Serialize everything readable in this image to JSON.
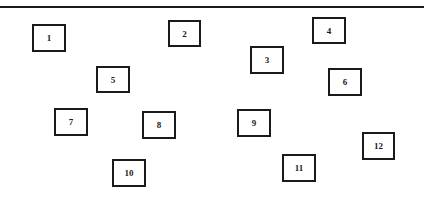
{
  "diagram": {
    "boxes": [
      {
        "label": "1",
        "x": 32,
        "y": 24,
        "w": 34,
        "h": 28
      },
      {
        "label": "2",
        "x": 168,
        "y": 20,
        "w": 33,
        "h": 27
      },
      {
        "label": "3",
        "x": 250,
        "y": 46,
        "w": 34,
        "h": 28
      },
      {
        "label": "4",
        "x": 312,
        "y": 17,
        "w": 34,
        "h": 27
      },
      {
        "label": "5",
        "x": 96,
        "y": 66,
        "w": 34,
        "h": 27
      },
      {
        "label": "6",
        "x": 328,
        "y": 68,
        "w": 34,
        "h": 28
      },
      {
        "label": "7",
        "x": 54,
        "y": 108,
        "w": 34,
        "h": 28
      },
      {
        "label": "8",
        "x": 142,
        "y": 111,
        "w": 34,
        "h": 28
      },
      {
        "label": "9",
        "x": 237,
        "y": 109,
        "w": 34,
        "h": 28
      },
      {
        "label": "10",
        "x": 112,
        "y": 159,
        "w": 34,
        "h": 28
      },
      {
        "label": "11",
        "x": 282,
        "y": 154,
        "w": 34,
        "h": 28
      },
      {
        "label": "12",
        "x": 362,
        "y": 132,
        "w": 33,
        "h": 28
      }
    ]
  }
}
